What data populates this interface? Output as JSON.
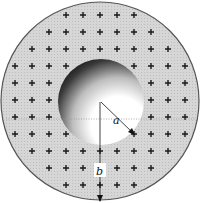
{
  "figure": {
    "outer_sphere": {
      "cx": 100,
      "cy": 101,
      "r": 99,
      "fill": "#d4d4d4",
      "stroke": "#555555",
      "label": "b"
    },
    "cavity": {
      "cx": 101,
      "cy": 101,
      "r": 43,
      "label": "a"
    },
    "charge_symbol": "+",
    "charge_color": "#1a1a1a",
    "labels": {
      "a": "a",
      "b": "b"
    },
    "colors": {
      "cavity_dark": "#111111",
      "cavity_light": "#ffffff",
      "background": "#ffffff"
    }
  }
}
